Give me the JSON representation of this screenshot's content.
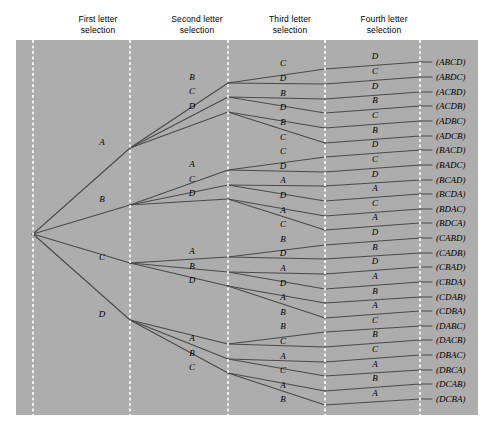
{
  "figure": {
    "panel": {
      "background_color": "#adadad",
      "x": 16,
      "y": 40,
      "width": 462,
      "height": 375
    },
    "stage_line_color": "#ffffff",
    "branch_color": "#4a4a4a",
    "text_color": "#000000"
  },
  "headers": [
    {
      "label": "First letter\nselection",
      "x": 98
    },
    {
      "label": "Second letter\nselection",
      "x": 197
    },
    {
      "label": "Third letter\nselection",
      "x": 290
    },
    {
      "label": "Fourth letter\nselection",
      "x": 384
    }
  ],
  "stage_lines_x": [
    33,
    130,
    228,
    325,
    420
  ],
  "root": {
    "x": 33,
    "y": 234
  },
  "chart_data": {
    "type": "tree",
    "levels": 4,
    "letters": [
      "A",
      "B",
      "C",
      "D"
    ],
    "outcome_count": 24,
    "stage_labels": [
      "First letter selection",
      "Second letter selection",
      "Third letter selection",
      "Fourth letter selection"
    ],
    "level1": [
      {
        "label": "A",
        "x": 130,
        "y": 148
      },
      {
        "label": "B",
        "x": 130,
        "y": 205
      },
      {
        "label": "C",
        "x": 130,
        "y": 263
      },
      {
        "label": "D",
        "x": 130,
        "y": 320
      }
    ],
    "level2": [
      {
        "label": "B",
        "x": 228,
        "y": 83,
        "parent": 0
      },
      {
        "label": "C",
        "x": 228,
        "y": 97,
        "parent": 0
      },
      {
        "label": "D",
        "x": 228,
        "y": 112,
        "parent": 0
      },
      {
        "label": "A",
        "x": 228,
        "y": 170,
        "parent": 1
      },
      {
        "label": "C",
        "x": 228,
        "y": 185,
        "parent": 1
      },
      {
        "label": "D",
        "x": 228,
        "y": 199,
        "parent": 1
      },
      {
        "label": "A",
        "x": 228,
        "y": 257,
        "parent": 2
      },
      {
        "label": "B",
        "x": 228,
        "y": 272,
        "parent": 2
      },
      {
        "label": "D",
        "x": 228,
        "y": 286,
        "parent": 2
      },
      {
        "label": "A",
        "x": 228,
        "y": 344,
        "parent": 3
      },
      {
        "label": "B",
        "x": 228,
        "y": 359,
        "parent": 3
      },
      {
        "label": "C",
        "x": 228,
        "y": 373,
        "parent": 3
      }
    ],
    "level3": [
      {
        "label": "C",
        "x": 325,
        "y": 69,
        "parent": 0
      },
      {
        "label": "D",
        "x": 325,
        "y": 84,
        "parent": 0
      },
      {
        "label": "B",
        "x": 325,
        "y": 99,
        "parent": 1
      },
      {
        "label": "D",
        "x": 325,
        "y": 113,
        "parent": 1
      },
      {
        "label": "B",
        "x": 325,
        "y": 128,
        "parent": 2
      },
      {
        "label": "C",
        "x": 325,
        "y": 143,
        "parent": 2
      },
      {
        "label": "C",
        "x": 325,
        "y": 157,
        "parent": 3
      },
      {
        "label": "D",
        "x": 325,
        "y": 172,
        "parent": 3
      },
      {
        "label": "A",
        "x": 325,
        "y": 186,
        "parent": 4
      },
      {
        "label": "D",
        "x": 325,
        "y": 201,
        "parent": 4
      },
      {
        "label": "A",
        "x": 325,
        "y": 216,
        "parent": 5
      },
      {
        "label": "C",
        "x": 325,
        "y": 230,
        "parent": 5
      },
      {
        "label": "B",
        "x": 325,
        "y": 245,
        "parent": 6
      },
      {
        "label": "D",
        "x": 325,
        "y": 259,
        "parent": 6
      },
      {
        "label": "A",
        "x": 325,
        "y": 274,
        "parent": 7
      },
      {
        "label": "D",
        "x": 325,
        "y": 289,
        "parent": 7
      },
      {
        "label": "A",
        "x": 325,
        "y": 303,
        "parent": 8
      },
      {
        "label": "B",
        "x": 325,
        "y": 318,
        "parent": 8
      },
      {
        "label": "B",
        "x": 325,
        "y": 332,
        "parent": 9
      },
      {
        "label": "C",
        "x": 325,
        "y": 347,
        "parent": 9
      },
      {
        "label": "A",
        "x": 325,
        "y": 362,
        "parent": 10
      },
      {
        "label": "C",
        "x": 325,
        "y": 376,
        "parent": 10
      },
      {
        "label": "A",
        "x": 325,
        "y": 391,
        "parent": 11
      },
      {
        "label": "B",
        "x": 325,
        "y": 405,
        "parent": 11
      }
    ],
    "level4": [
      {
        "label": "D",
        "x": 420,
        "y": 62,
        "outcome": "(ABCD)",
        "parent": 0
      },
      {
        "label": "C",
        "x": 420,
        "y": 77,
        "outcome": "(ABDC)",
        "parent": 1
      },
      {
        "label": "D",
        "x": 420,
        "y": 92,
        "outcome": "(ACBD)",
        "parent": 2
      },
      {
        "label": "B",
        "x": 420,
        "y": 106,
        "outcome": "(ACDB)",
        "parent": 3
      },
      {
        "label": "C",
        "x": 420,
        "y": 121,
        "outcome": "(ADBC)",
        "parent": 4
      },
      {
        "label": "B",
        "x": 420,
        "y": 136,
        "outcome": "(ADCB)",
        "parent": 5
      },
      {
        "label": "D",
        "x": 420,
        "y": 150,
        "outcome": "(BACD)",
        "parent": 6
      },
      {
        "label": "C",
        "x": 420,
        "y": 165,
        "outcome": "(BADC)",
        "parent": 7
      },
      {
        "label": "D",
        "x": 420,
        "y": 180,
        "outcome": "(BCAD)",
        "parent": 8
      },
      {
        "label": "A",
        "x": 420,
        "y": 194,
        "outcome": "(BCDA)",
        "parent": 9
      },
      {
        "label": "C",
        "x": 420,
        "y": 209,
        "outcome": "(BDAC)",
        "parent": 10
      },
      {
        "label": "A",
        "x": 420,
        "y": 223,
        "outcome": "(BDCA)",
        "parent": 11
      },
      {
        "label": "D",
        "x": 420,
        "y": 238,
        "outcome": "(CABD)",
        "parent": 12
      },
      {
        "label": "B",
        "x": 420,
        "y": 253,
        "outcome": "(CADB)",
        "parent": 13
      },
      {
        "label": "D",
        "x": 420,
        "y": 267,
        "outcome": "(CBAD)",
        "parent": 14
      },
      {
        "label": "A",
        "x": 420,
        "y": 282,
        "outcome": "(CBDA)",
        "parent": 15
      },
      {
        "label": "B",
        "x": 420,
        "y": 297,
        "outcome": "(CDAB)",
        "parent": 16
      },
      {
        "label": "A",
        "x": 420,
        "y": 311,
        "outcome": "(CDBA)",
        "parent": 17
      },
      {
        "label": "C",
        "x": 420,
        "y": 326,
        "outcome": "(DABC)",
        "parent": 18
      },
      {
        "label": "B",
        "x": 420,
        "y": 340,
        "outcome": "(DACB)",
        "parent": 19
      },
      {
        "label": "C",
        "x": 420,
        "y": 355,
        "outcome": "(DBAC)",
        "parent": 20
      },
      {
        "label": "A",
        "x": 420,
        "y": 370,
        "outcome": "(DBCA)",
        "parent": 21
      },
      {
        "label": "B",
        "x": 420,
        "y": 384,
        "outcome": "(DCAB)",
        "parent": 22
      },
      {
        "label": "A",
        "x": 420,
        "y": 399,
        "outcome": "(DCBA)",
        "parent": 23
      }
    ],
    "outcomes": [
      "(ABCD)",
      "(ABDC)",
      "(ACBD)",
      "(ACDB)",
      "(ADBC)",
      "(ADCB)",
      "(BACD)",
      "(BADC)",
      "(BCAD)",
      "(BCDA)",
      "(BDAC)",
      "(BDCA)",
      "(CABD)",
      "(CADB)",
      "(CBAD)",
      "(CBDA)",
      "(CDAB)",
      "(CDBA)",
      "(DABC)",
      "(DACB)",
      "(DBAC)",
      "(DBCA)",
      "(DCAB)",
      "(DCBA)"
    ]
  }
}
